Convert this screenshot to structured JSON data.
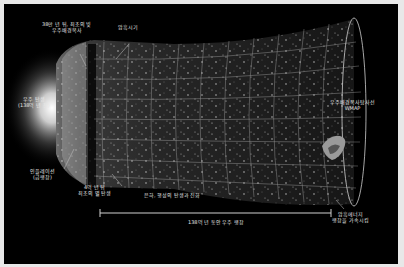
{
  "diagram": {
    "type": "universe-timeline",
    "labels": {
      "cmb_line1": "38만 년 뒤, 최초의 빛",
      "cmb_line2": "우주배경복사",
      "dark_ages": "암흑시기",
      "big_bang_line1": "우주 탄생",
      "big_bang_line2": "(138억 년 전)",
      "inflation_line1": "인플레이션",
      "inflation_line2": "(급팽창)",
      "first_stars_line1": "4억 년 뒤",
      "first_stars_line2": "최초의 별 탄생",
      "galaxy_evolution": "은하, 행성의 탄생과 진화",
      "expansion": "138억 년 동안 우주 팽창",
      "wmap_line1": "우주배경복사탐사선",
      "wmap_line2": "WMAP",
      "dark_energy_line1": "암흑에너지",
      "dark_energy_line2": "팽창을 가속시킴"
    },
    "colors": {
      "background": "#000000",
      "frame": "#e8e8e8",
      "text": "#e6e6e6",
      "grid": "#bfbfbf"
    }
  }
}
